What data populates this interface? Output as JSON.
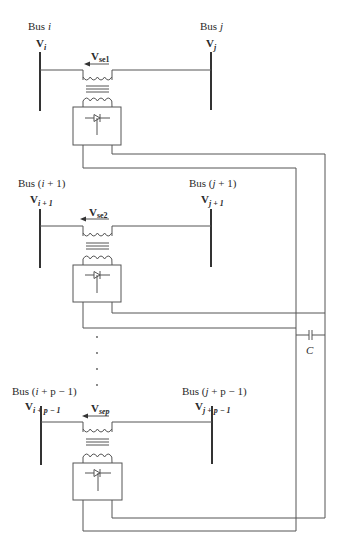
{
  "diagram": {
    "sections": [
      {
        "left_bus": {
          "name": "Bus ",
          "name_var": "i",
          "name_suffix": "",
          "voltage": "V",
          "voltage_sub": "i"
        },
        "right_bus": {
          "name": "Bus ",
          "name_var": "j",
          "name_suffix": "",
          "voltage": "V",
          "voltage_sub": "j"
        },
        "series_voltage": {
          "base": "V",
          "sub": "se1"
        }
      },
      {
        "left_bus": {
          "name": "Bus (",
          "name_var": "i",
          "name_suffix": " + 1)",
          "voltage": "V",
          "voltage_sub": "i + 1"
        },
        "right_bus": {
          "name": "Bus (",
          "name_var": "j",
          "name_suffix": " + 1)",
          "voltage": "V",
          "voltage_sub": "j + 1"
        },
        "series_voltage": {
          "base": "V",
          "sub": "se2"
        }
      },
      {
        "left_bus": {
          "name": "Bus (",
          "name_var": "i",
          "name_suffix": " + p − 1)",
          "voltage": "V",
          "voltage_sub": "i + p − 1"
        },
        "right_bus": {
          "name": "Bus (",
          "name_var": "j",
          "name_suffix": " + p − 1)",
          "voltage": "V",
          "voltage_sub": "j + p − 1"
        },
        "series_voltage": {
          "base": "V",
          "sub": "sep"
        }
      }
    ],
    "capacitor_label": "C",
    "ellipsis_dots": 4
  }
}
